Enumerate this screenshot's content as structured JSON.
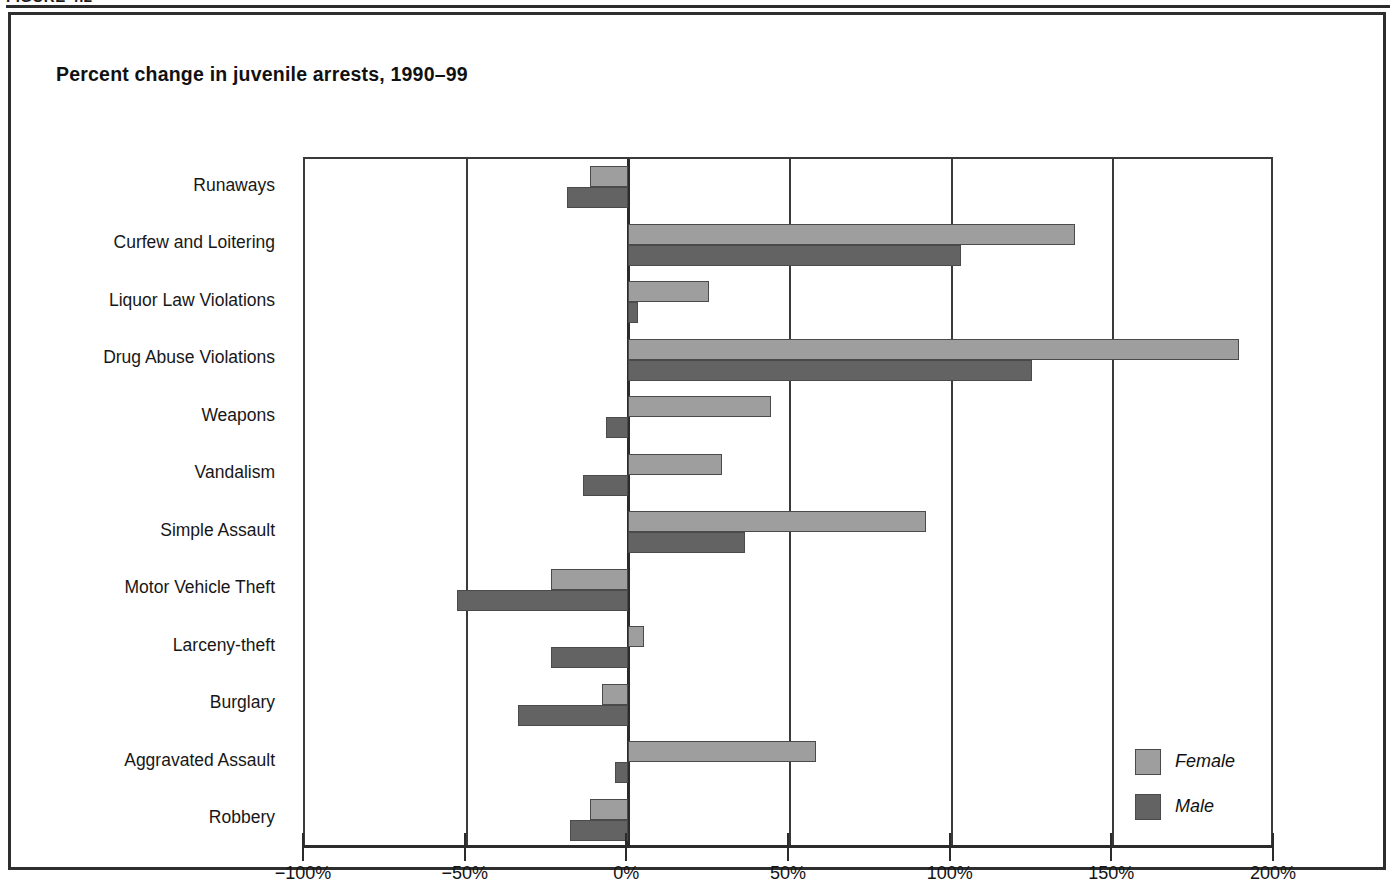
{
  "figure": {
    "caption": "FIGURE 4.2"
  },
  "chart_data": {
    "type": "bar",
    "orientation": "horizontal",
    "title": "Percent change in juvenile arrests, 1990–99",
    "xlabel": "",
    "ylabel": "",
    "xlim": [
      -100,
      200
    ],
    "xtick_values": [
      -100,
      -50,
      0,
      50,
      100,
      150,
      200
    ],
    "xtick_labels": [
      "−100%",
      "−50%",
      "0%",
      "50%",
      "100%",
      "150%",
      "200%"
    ],
    "grid": true,
    "grid_axis": "x",
    "legend_position": "bottom-right",
    "categories": [
      "Runaways",
      "Curfew and Loitering",
      "Liquor Law Violations",
      "Drug Abuse Violations",
      "Weapons",
      "Vandalism",
      "Simple Assault",
      "Motor Vehicle Theft",
      "Larceny-theft",
      "Burglary",
      "Aggravated Assault",
      "Robbery"
    ],
    "series": [
      {
        "name": "Female",
        "color": "#9e9e9e",
        "values": [
          -12,
          138,
          25,
          189,
          44,
          29,
          92,
          -24,
          5,
          -8,
          58,
          -12
        ]
      },
      {
        "name": "Male",
        "color": "#636363",
        "values": [
          -19,
          103,
          3,
          125,
          -7,
          -14,
          36,
          -53,
          -24,
          -34,
          -4,
          -18
        ]
      }
    ]
  },
  "legend": {
    "items": [
      {
        "label": "Female",
        "swatch": "female"
      },
      {
        "label": "Male",
        "swatch": "male"
      }
    ]
  }
}
